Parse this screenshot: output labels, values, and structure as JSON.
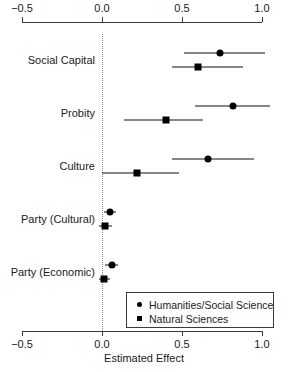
{
  "chart_data": {
    "type": "scatter",
    "title": "",
    "xlabel": "Estimated Effect",
    "ylabel": "",
    "xlim": [
      -0.5,
      1.0
    ],
    "xticks": [
      -0.5,
      0.0,
      0.5,
      1.0
    ],
    "xticklabels": [
      "−0.5",
      "0.0",
      "0.5",
      "1.0"
    ],
    "grid": false,
    "reference_line": 0.0,
    "reference_line_style": "dotted",
    "axis_position": [
      "top",
      "bottom"
    ],
    "legend": {
      "position": "bottom-right",
      "entries": [
        {
          "label": "Humanities/Social Science",
          "marker": "circle"
        },
        {
          "label": "Natural Sciences",
          "marker": "square"
        }
      ]
    },
    "categories": [
      "Social Capital",
      "Probity",
      "Culture",
      "Party (Cultural)",
      "Party (Economic)"
    ],
    "series": [
      {
        "name": "Humanities/Social Science",
        "marker": "circle",
        "values": [
          0.74,
          0.82,
          0.66,
          0.05,
          0.06
        ],
        "ci_low": [
          0.51,
          0.58,
          0.44,
          0.01,
          0.02
        ],
        "ci_high": [
          1.02,
          1.05,
          0.95,
          0.09,
          0.1
        ]
      },
      {
        "name": "Natural Sciences",
        "marker": "square",
        "values": [
          0.6,
          0.4,
          0.22,
          0.02,
          0.01
        ],
        "ci_low": [
          0.44,
          0.14,
          0.0,
          -0.02,
          -0.02
        ],
        "ci_high": [
          0.88,
          0.63,
          0.48,
          0.06,
          0.05
        ]
      }
    ]
  },
  "colors": {
    "marker": "#000000",
    "axis": "#3a3a3a",
    "reference_line": "#8a8a8a",
    "background": "#ffffff"
  }
}
